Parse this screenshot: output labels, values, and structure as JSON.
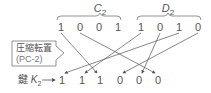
{
  "groups": [
    {
      "label": "C",
      "sub": "2",
      "x": 100,
      "y": 10
    },
    {
      "label": "D",
      "sub": "2",
      "x": 168,
      "y": 10
    }
  ],
  "input_bits": [
    {
      "v": "1",
      "x": 61
    },
    {
      "v": "0",
      "x": 80
    },
    {
      "v": "0",
      "x": 99
    },
    {
      "v": "1",
      "x": 118
    },
    {
      "v": "1",
      "x": 141
    },
    {
      "v": "0",
      "x": 160
    },
    {
      "v": "1",
      "x": 179
    },
    {
      "v": "0",
      "x": 198
    }
  ],
  "output_bits": [
    {
      "v": "1",
      "x": 62
    },
    {
      "v": "1",
      "x": 82
    },
    {
      "v": "1",
      "x": 100
    },
    {
      "v": "0",
      "x": 120
    },
    {
      "v": "0",
      "x": 139
    },
    {
      "v": "0",
      "x": 158
    }
  ],
  "mapping": [
    {
      "from": 0,
      "to": 2
    },
    {
      "from": 1,
      "to": 5
    },
    {
      "from": 4,
      "to": 1
    },
    {
      "from": 6,
      "to": 0
    },
    {
      "from": 5,
      "to": 4
    },
    {
      "from": 7,
      "to": 3
    }
  ],
  "callout": {
    "line1": "圧縮転置",
    "line2": "(PC-2)"
  },
  "key": {
    "prefix": "鍵",
    "var": "K",
    "sub": "2"
  },
  "colors": {
    "line": "#555555",
    "text": "#555555"
  }
}
